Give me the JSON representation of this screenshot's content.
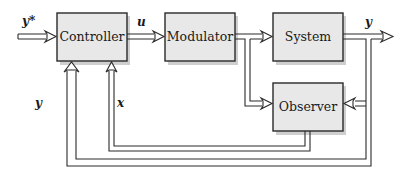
{
  "diagram": {
    "type": "block-diagram",
    "blocks": {
      "controller": {
        "label": "Controller"
      },
      "modulator": {
        "label": "Modulator"
      },
      "system": {
        "label": "System"
      },
      "observer": {
        "label": "Observer"
      }
    },
    "signals": {
      "reference": "y*",
      "control": "u",
      "output": "y",
      "feedback_output": "y",
      "state_estimate": "x"
    },
    "connections": [
      {
        "from": "reference",
        "to": "controller",
        "label": "y*"
      },
      {
        "from": "controller",
        "to": "modulator",
        "label": "u"
      },
      {
        "from": "modulator",
        "to": "system"
      },
      {
        "from": "modulator",
        "to": "observer"
      },
      {
        "from": "system",
        "to": "output",
        "label": "y"
      },
      {
        "from": "system",
        "to": "observer"
      },
      {
        "from": "observer",
        "to": "controller",
        "label": "x"
      },
      {
        "from": "system",
        "to": "controller",
        "label": "y"
      }
    ],
    "colors": {
      "block_fill": "#e8e8e8",
      "stroke": "#2a2a2a",
      "background": "#ffffff"
    }
  }
}
